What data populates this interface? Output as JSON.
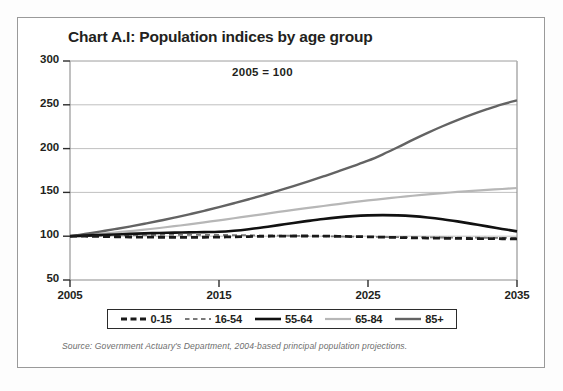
{
  "figure": {
    "title": "Chart A.I: Population indices by age group",
    "annotation": "2005 = 100",
    "source": "Source: Government Actuary's Department, 2004-based principal population projections."
  },
  "legend": {
    "entries": [
      {
        "label": "0-15",
        "style": "dashed",
        "color": "#1a1a1a",
        "width": 2.8
      },
      {
        "label": "16-54",
        "style": "dashed",
        "color": "#7a7a7a",
        "width": 1.8
      },
      {
        "label": "55-64",
        "style": "solid",
        "color": "#111111",
        "width": 2.6
      },
      {
        "label": "65-84",
        "style": "solid",
        "color": "#b7b7b7",
        "width": 2.2
      },
      {
        "label": "85+",
        "style": "solid",
        "color": "#636363",
        "width": 2.4
      }
    ]
  },
  "axes": {
    "y_ticks": [
      "300",
      "250",
      "200",
      "150",
      "100",
      "50"
    ],
    "x_ticks": [
      "2005",
      "2015",
      "2025",
      "2035"
    ]
  },
  "chart_data": {
    "type": "line",
    "title": "Chart A.I: Population indices by age group",
    "subtitle": "2005 = 100",
    "xlabel": "",
    "ylabel": "",
    "xlim": [
      2005,
      2035
    ],
    "ylim": [
      50,
      300
    ],
    "grid": true,
    "legend_position": "bottom",
    "x": [
      2005,
      2006,
      2007,
      2008,
      2009,
      2010,
      2011,
      2012,
      2013,
      2014,
      2015,
      2016,
      2017,
      2018,
      2019,
      2020,
      2021,
      2022,
      2023,
      2024,
      2025,
      2026,
      2027,
      2028,
      2029,
      2030,
      2031,
      2032,
      2033,
      2034,
      2035
    ],
    "series": [
      {
        "name": "0-15",
        "values": [
          100,
          100,
          99.7,
          99.4,
          99.1,
          98.9,
          98.8,
          98.7,
          98.7,
          98.8,
          99.0,
          99.3,
          99.6,
          99.9,
          100.1,
          100.2,
          100.2,
          100.1,
          99.9,
          99.6,
          99.3,
          98.9,
          98.5,
          98.2,
          97.9,
          97.7,
          97.5,
          97.3,
          97.2,
          97.1,
          97.0
        ]
      },
      {
        "name": "16-54",
        "values": [
          100,
          100.3,
          100.6,
          100.9,
          101.1,
          101.3,
          101.4,
          101.5,
          101.5,
          101.5,
          101.4,
          101.3,
          101.1,
          100.9,
          100.7,
          100.5,
          100.2,
          100.0,
          99.7,
          99.5,
          99.3,
          99.1,
          98.9,
          98.7,
          98.6,
          98.5,
          98.4,
          98.3,
          98.2,
          98.1,
          98.0
        ]
      },
      {
        "name": "55-64",
        "values": [
          100,
          100.6,
          101.3,
          102.0,
          102.6,
          103.2,
          103.7,
          104.1,
          104.4,
          104.7,
          105.0,
          106.2,
          108.0,
          110.2,
          112.6,
          115.1,
          117.5,
          119.7,
          121.5,
          122.9,
          123.8,
          124.1,
          123.8,
          122.9,
          121.4,
          119.4,
          116.9,
          114.1,
          111.2,
          108.3,
          105.5
        ]
      },
      {
        "name": "65-84",
        "values": [
          100,
          101.3,
          102.7,
          104.2,
          105.8,
          107.5,
          109.4,
          111.4,
          113.5,
          115.8,
          118.1,
          120.5,
          122.9,
          125.3,
          127.7,
          130.0,
          132.3,
          134.5,
          136.7,
          138.8,
          140.8,
          142.7,
          144.5,
          146.2,
          147.8,
          149.2,
          150.5,
          151.7,
          152.8,
          153.9,
          155.0
        ]
      },
      {
        "name": "85+",
        "values": [
          100,
          102.5,
          105.2,
          108.0,
          111.0,
          114.2,
          117.6,
          121.2,
          125.0,
          129.0,
          133.2,
          137.6,
          142.2,
          147.0,
          152.0,
          157.2,
          162.6,
          168.2,
          174.0,
          180.0,
          186.2,
          193.5,
          201.5,
          210.0,
          218.0,
          225.5,
          232.5,
          239.0,
          245.0,
          250.5,
          255.0
        ]
      }
    ]
  }
}
